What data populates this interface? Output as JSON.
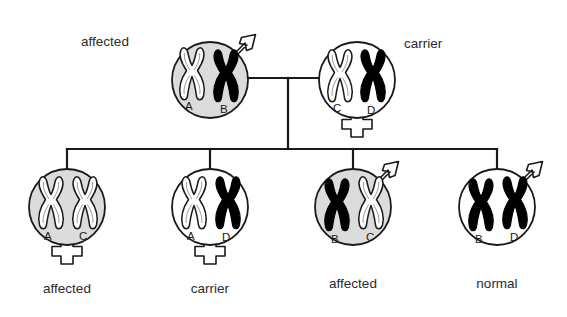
{
  "diagram": {
    "colors": {
      "shaded_fill": "#dcdcdc",
      "unshaded_fill": "#ffffff",
      "black_chromosome": "#000000",
      "white_chromosome": "#ffffff",
      "stroke": "#1a1a1a",
      "text": "#2b2b2b"
    }
  },
  "parents": {
    "father": {
      "status_label": "affected",
      "sex": "male",
      "sex_symbol": "arrow-icon",
      "shaded": true,
      "chromosomes": [
        {
          "letter": "A",
          "fill": "white"
        },
        {
          "letter": "B",
          "fill": "black"
        }
      ]
    },
    "mother": {
      "status_label": "carrier",
      "sex": "female",
      "sex_symbol": "cross-icon",
      "shaded": false,
      "chromosomes": [
        {
          "letter": "C",
          "fill": "white"
        },
        {
          "letter": "D",
          "fill": "black"
        }
      ]
    }
  },
  "children": [
    {
      "status_label": "affected",
      "sex": "female",
      "sex_symbol": "cross-icon",
      "shaded": true,
      "chromosomes": [
        {
          "letter": "A",
          "fill": "white"
        },
        {
          "letter": "C",
          "fill": "white"
        }
      ]
    },
    {
      "status_label": "carrier",
      "sex": "female",
      "sex_symbol": "cross-icon",
      "shaded": false,
      "chromosomes": [
        {
          "letter": "A",
          "fill": "white"
        },
        {
          "letter": "D",
          "fill": "black"
        }
      ]
    },
    {
      "status_label": "affected",
      "sex": "male",
      "sex_symbol": "arrow-icon",
      "shaded": true,
      "chromosomes": [
        {
          "letter": "B",
          "fill": "black"
        },
        {
          "letter": "C",
          "fill": "white"
        }
      ]
    },
    {
      "status_label": "normal",
      "sex": "male",
      "sex_symbol": "arrow-icon",
      "shaded": false,
      "chromosomes": [
        {
          "letter": "B",
          "fill": "black"
        },
        {
          "letter": "D",
          "fill": "black"
        }
      ]
    }
  ]
}
